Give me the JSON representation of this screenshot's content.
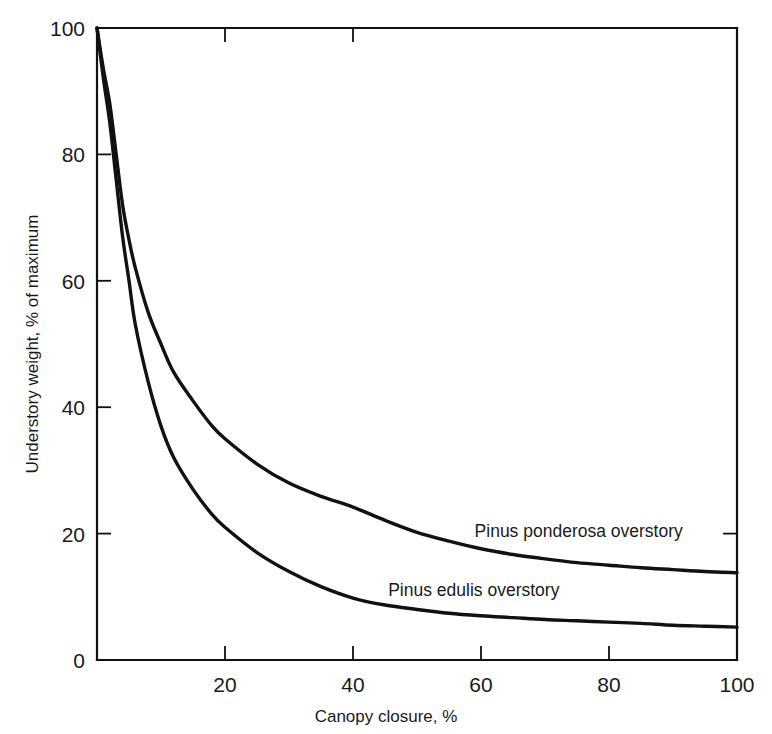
{
  "chart_data": {
    "type": "line",
    "title": "",
    "subtitle": "",
    "xlabel": "Canopy closure, %",
    "ylabel": "Understory weight, % of maximum",
    "xlim": [
      0,
      100
    ],
    "ylim": [
      0,
      100
    ],
    "xticks": [
      0,
      20,
      40,
      60,
      80,
      100
    ],
    "xticklabels": [
      "",
      "20",
      "40",
      "60",
      "80",
      "100"
    ],
    "yticks": [
      0,
      20,
      40,
      60,
      80,
      100
    ],
    "yticklabels": [
      "0",
      "20",
      "40",
      "60",
      "80",
      "100"
    ],
    "grid": false,
    "legend_position": "inline-annotation",
    "line_color": "#111111",
    "background_color": "#ffffff",
    "series": [
      {
        "name": "Pinus ponderosa overstory",
        "annotation": "Pinus ponderosa overstory",
        "annotation_x": 59,
        "annotation_y": 19.5,
        "x": [
          0,
          1,
          2,
          3,
          4,
          5,
          6,
          8,
          10,
          12,
          15,
          18,
          20,
          25,
          30,
          35,
          40,
          45,
          50,
          55,
          60,
          65,
          70,
          75,
          80,
          85,
          90,
          95,
          100
        ],
        "values": [
          100,
          93.5,
          88,
          80,
          72,
          66.5,
          62,
          55,
          50,
          45.5,
          41,
          37,
          35,
          31,
          28,
          25.9,
          24.2,
          22.1,
          20.2,
          18.8,
          17.6,
          16.7,
          16.0,
          15.4,
          15.0,
          14.6,
          14.3,
          14.0,
          13.8
        ]
      },
      {
        "name": "Pinus edulis overstory",
        "annotation": "Pinus edulis overstory",
        "annotation_x": 45.5,
        "annotation_y": 10.2,
        "x": [
          0,
          1,
          2,
          3,
          4,
          5,
          6,
          8,
          10,
          12,
          15,
          18,
          20,
          25,
          30,
          35,
          40,
          45,
          50,
          55,
          60,
          65,
          70,
          75,
          80,
          85,
          90,
          95,
          100
        ],
        "values": [
          100,
          92,
          85,
          76,
          67,
          60,
          53,
          44,
          37,
          32,
          27,
          23,
          21,
          17,
          14,
          11.6,
          9.8,
          8.7,
          8.0,
          7.4,
          7.0,
          6.7,
          6.4,
          6.2,
          6.0,
          5.8,
          5.5,
          5.35,
          5.2
        ]
      }
    ]
  },
  "axes": {
    "y_title": "Understory weight, % of maximum",
    "x_title": "Canopy closure, %"
  }
}
